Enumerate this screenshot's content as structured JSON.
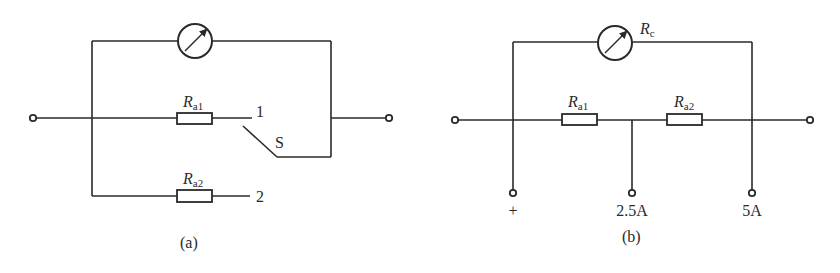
{
  "figure_a": {
    "caption": "(a)",
    "meter": {
      "icon": "galvanometer-icon"
    },
    "resistor1": {
      "symbol": "R",
      "subscript": "a1"
    },
    "resistor2": {
      "symbol": "R",
      "subscript": "a2"
    },
    "switch_label": "S",
    "contact1_label": "1",
    "contact2_label": "2"
  },
  "figure_b": {
    "caption": "(b)",
    "meter": {
      "icon": "galvanometer-icon",
      "symbol": "R",
      "subscript": "c"
    },
    "resistor1": {
      "symbol": "R",
      "subscript": "a1"
    },
    "resistor2": {
      "symbol": "R",
      "subscript": "a2"
    },
    "terminals": [
      {
        "label": "+"
      },
      {
        "label": "2.5A"
      },
      {
        "label": "5A"
      }
    ]
  },
  "colors": {
    "line": "#2a2a2a",
    "background": "#ffffff"
  }
}
